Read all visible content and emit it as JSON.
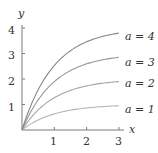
{
  "chart_data": {
    "type": "line",
    "title": "",
    "xlabel": "x",
    "ylabel": "y",
    "xlim": [
      0,
      3
    ],
    "ylim": [
      0,
      4
    ],
    "x_ticks": [
      "1",
      "2",
      "3"
    ],
    "y_ticks": [
      "1",
      "2",
      "3",
      "4"
    ],
    "grid": false,
    "legend_position": "inline-right",
    "x": [
      0,
      0.25,
      0.5,
      0.75,
      1,
      1.25,
      1.5,
      1.75,
      2,
      2.25,
      2.5,
      2.75,
      3
    ],
    "series": [
      {
        "name": "a = 1",
        "a": 1,
        "color": "#b4b4b4",
        "values": [
          0,
          0.22,
          0.39,
          0.53,
          0.63,
          0.71,
          0.78,
          0.83,
          0.86,
          0.89,
          0.92,
          0.94,
          0.95
        ]
      },
      {
        "name": "a = 2",
        "a": 2,
        "color": "#a6a6a6",
        "values": [
          0,
          0.44,
          0.79,
          1.06,
          1.26,
          1.43,
          1.55,
          1.65,
          1.73,
          1.79,
          1.84,
          1.87,
          1.9
        ]
      },
      {
        "name": "a = 3",
        "a": 3,
        "color": "#979797",
        "values": [
          0,
          0.66,
          1.18,
          1.58,
          1.9,
          2.14,
          2.33,
          2.48,
          2.59,
          2.68,
          2.75,
          2.81,
          2.85
        ]
      },
      {
        "name": "a = 4",
        "a": 4,
        "color": "#888888",
        "values": [
          0,
          0.88,
          1.57,
          2.11,
          2.53,
          2.85,
          3.11,
          3.31,
          3.46,
          3.58,
          3.67,
          3.74,
          3.8
        ]
      }
    ]
  },
  "axes": {
    "x_label": "x",
    "y_label": "y",
    "x_tick_labels": [
      "1",
      "2",
      "3"
    ],
    "y_tick_labels": [
      "1",
      "2",
      "3",
      "4"
    ]
  },
  "labels": [
    "a = 4",
    "a = 3",
    "a = 2",
    "a = 1"
  ],
  "colors": {
    "axis": "#7a7a7a",
    "text": "#333333"
  }
}
